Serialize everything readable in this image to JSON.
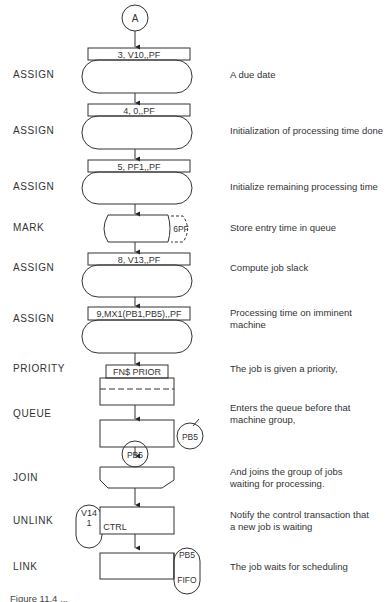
{
  "diagram": {
    "connector": {
      "label": "A"
    },
    "blocks": [
      {
        "type": "ASSIGN",
        "operand": "3, V10,,PF",
        "comment": "A due date"
      },
      {
        "type": "ASSIGN",
        "operand": "4, 0,,PF",
        "comment": "Initialization of processing time done"
      },
      {
        "type": "ASSIGN",
        "operand": "5, PF1,,PF",
        "comment": "Initialize remaining processing time"
      },
      {
        "type": "MARK",
        "operand": "6PF",
        "comment": "Store entry time in queue"
      },
      {
        "type": "ASSIGN",
        "operand": "8, V13,,PF",
        "comment": "Compute job slack"
      },
      {
        "type": "ASSIGN",
        "operand": "9,MX1(PB1,PB5),,PF",
        "comment": "Processing time on imminent machine",
        "comment_lines": [
          "Processing time on imminent",
          "machine"
        ]
      },
      {
        "type": "PRIORITY",
        "operand": "FN$ PRIOR",
        "comment": "The job is given a priority,"
      },
      {
        "type": "QUEUE",
        "operand": "PB5",
        "comment": "Enters the queue before that machine group,",
        "comment_lines": [
          "Enters the queue before that",
          "machine group,"
        ]
      },
      {
        "type": "JOIN",
        "operand": "PB5",
        "comment": "And joins the group of jobs waiting for processing.",
        "comment_lines": [
          "And joins the group of jobs",
          "waiting for processing."
        ]
      },
      {
        "type": "UNLINK",
        "operand_top": "V14",
        "operand_mid": "1",
        "operand_inner": "CTRL",
        "comment": "Notify the control transaction that a new job is waiting",
        "comment_lines": [
          "Notify the control transaction that",
          "a new job is waiting"
        ]
      },
      {
        "type": "LINK",
        "operand_top": "PB5",
        "operand_bottom": "FIFO",
        "comment": "The job waits for scheduling"
      }
    ]
  },
  "caption": "Figure 11.4 ..."
}
